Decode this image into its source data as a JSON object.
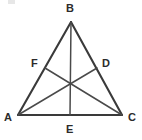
{
  "figure": {
    "type": "geometry-diagram",
    "shape": "triangle",
    "background_color": "#ffffff",
    "line_color": "#3a3a3a",
    "label_color": "#2b2b2b",
    "width": 142,
    "height": 140
  },
  "points": {
    "A": {
      "label": "A",
      "x": 18,
      "y": 115,
      "label_x": 4,
      "label_y": 112,
      "role": "vertex"
    },
    "B": {
      "label": "B",
      "x": 71,
      "y": 22,
      "label_x": 66,
      "label_y": 3,
      "role": "vertex"
    },
    "C": {
      "label": "C",
      "x": 122,
      "y": 115,
      "label_x": 128,
      "label_y": 112,
      "role": "vertex"
    },
    "D": {
      "label": "D",
      "x": 97,
      "y": 68,
      "label_x": 102,
      "label_y": 58,
      "role": "point-on-side-BC"
    },
    "E": {
      "label": "E",
      "x": 70,
      "y": 115,
      "label_x": 66,
      "label_y": 124,
      "role": "point-on-side-AC"
    },
    "F": {
      "label": "F",
      "x": 45,
      "y": 68,
      "label_x": 31,
      "label_y": 58,
      "role": "point-on-side-AB"
    },
    "G": {
      "x": 70,
      "y": 86,
      "role": "intersection-point"
    }
  },
  "sides": [
    {
      "name": "side-AB",
      "from": "A",
      "to": "B"
    },
    {
      "name": "side-BC",
      "from": "B",
      "to": "C"
    },
    {
      "name": "side-AC",
      "from": "A",
      "to": "C"
    }
  ],
  "cevians": [
    {
      "name": "cevian-AD",
      "from": "A",
      "to": "D"
    },
    {
      "name": "cevian-BE",
      "from": "B",
      "to": "E"
    },
    {
      "name": "cevian-CF",
      "from": "C",
      "to": "F"
    }
  ],
  "labels": {
    "A": "A",
    "B": "B",
    "C": "C",
    "D": "D",
    "E": "E",
    "F": "F"
  }
}
